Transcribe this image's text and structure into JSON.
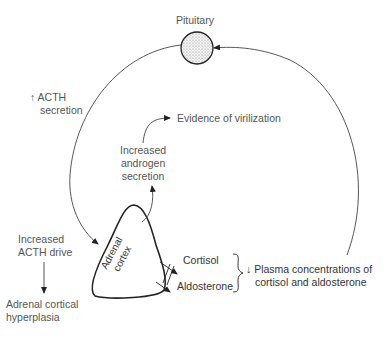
{
  "diagram": {
    "type": "feedback-loop",
    "nodes": {
      "pituitary": "Pituitary",
      "adrenal_cortex_line1": "Adrenal",
      "adrenal_cortex_line2": "cortex",
      "cortisol": "Cortisol",
      "aldosterone": "Aldosterone"
    },
    "labels": {
      "acth_secretion_arrow": "↑",
      "acth_secretion_line1": "ACTH",
      "acth_secretion_line2": "secretion",
      "virilization": "Evidence of virilization",
      "androgen_line1": "Increased",
      "androgen_line2": "androgen",
      "androgen_line3": "secretion",
      "acth_drive_line1": "Increased",
      "acth_drive_line2": "ACTH drive",
      "hyperplasia_line1": "Adrenal cortical",
      "hyperplasia_line2": "hyperplasia",
      "plasma_arrow": "↓",
      "plasma_line1": "Plasma concentrations of",
      "plasma_line2": "cortisol and aldosterone"
    },
    "edges": [
      {
        "from": "Pituitary",
        "to": "Adrenal cortex",
        "label": "↑ ACTH secretion"
      },
      {
        "from": "Adrenal cortex",
        "to": "Increased androgen secretion"
      },
      {
        "from": "Increased androgen secretion",
        "to": "Evidence of virilization"
      },
      {
        "from": "Adrenal cortex",
        "to": "Cortisol",
        "blocked": true
      },
      {
        "from": "Adrenal cortex",
        "to": "Aldosterone",
        "blocked": true
      },
      {
        "from": "Plasma concentrations",
        "to": "Pituitary",
        "label": "↓ Plasma concentrations of cortisol and aldosterone"
      },
      {
        "from": "Increased ACTH drive",
        "to": "Adrenal cortical hyperplasia"
      }
    ]
  }
}
